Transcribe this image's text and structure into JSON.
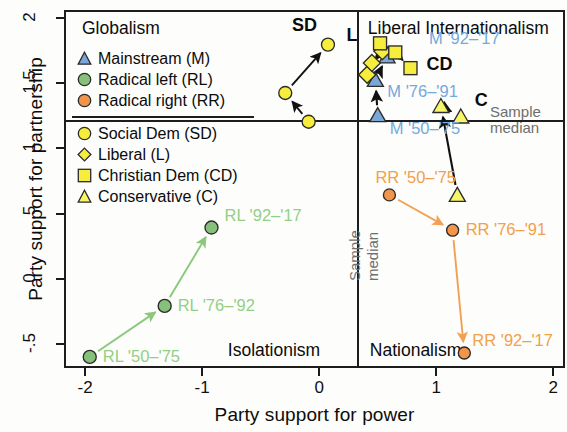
{
  "chart_data": {
    "type": "scatter",
    "title": "",
    "xlabel": "Party support for power",
    "ylabel": "Party support for partnership",
    "xlim": [
      -2.18,
      2.1
    ],
    "ylim": [
      -0.68,
      2.06
    ],
    "xticks": [
      "-2",
      "-1",
      "0",
      "1",
      "2"
    ],
    "xtick_values": [
      -2,
      -1,
      0,
      1,
      2
    ],
    "yticks": [
      "-.5",
      "0",
      ".5",
      "1",
      "1.5",
      "2"
    ],
    "ytick_values": [
      -0.5,
      0,
      0.5,
      1,
      1.5,
      2
    ],
    "grid": false,
    "legend_position": "top-left-inside",
    "sample_median": {
      "x": 0.33,
      "y": 1.21,
      "label": "Sample median"
    },
    "quadrant_labels": [
      {
        "text": "Globalism",
        "quadrant": "top-left"
      },
      {
        "text": "Liberal Internationalism",
        "quadrant": "top-right"
      },
      {
        "text": "Isolationism",
        "quadrant": "bottom-left"
      },
      {
        "text": "Nationalism",
        "quadrant": "bottom-right"
      }
    ],
    "legend_groups": [
      {
        "entries": [
          {
            "symbol": "triangle",
            "color": "#7BA7D7",
            "label": "Mainstream (M)",
            "key": "M"
          },
          {
            "symbol": "circle",
            "color": "#86C07A",
            "label": "Radical left (RL)",
            "key": "RL"
          },
          {
            "symbol": "circle",
            "color": "#F2944A",
            "label": "Radical right (RR)",
            "key": "RR"
          }
        ]
      },
      {
        "entries": [
          {
            "symbol": "circle",
            "color": "#F7ED3C",
            "label": "Social Dem (SD)",
            "key": "SD"
          },
          {
            "symbol": "diamond",
            "color": "#F7ED3C",
            "label": "Liberal (L)",
            "key": "L"
          },
          {
            "symbol": "square",
            "color": "#F7ED3C",
            "label": "Christian Dem (CD)",
            "key": "CD"
          },
          {
            "symbol": "triangle",
            "color": "#F7F66B",
            "label": "Conservative (C)",
            "key": "C"
          }
        ]
      }
    ],
    "series": [
      {
        "name": "Radical left (RL)",
        "key": "RL",
        "symbol": "circle",
        "color": "#86C07A",
        "points": [
          {
            "label": "RL '50–'75",
            "x": -1.96,
            "y": -0.595
          },
          {
            "label": "RL '76–'92",
            "x": -1.32,
            "y": -0.205
          },
          {
            "label": "RL '92–'17",
            "x": -0.92,
            "y": 0.395
          }
        ]
      },
      {
        "name": "Radical right (RR)",
        "key": "RR",
        "symbol": "circle",
        "color": "#F2944A",
        "points": [
          {
            "label": "RR '50–'75",
            "x": 0.6,
            "y": 0.645
          },
          {
            "label": "RR '76–'91",
            "x": 1.14,
            "y": 0.375
          },
          {
            "label": "RR '92–'17",
            "x": 1.24,
            "y": -0.565
          }
        ]
      },
      {
        "name": "Mainstream (M)",
        "key": "M",
        "symbol": "triangle",
        "color": "#7BA7D7",
        "points": [
          {
            "label": "M '50–'75",
            "x": 0.5,
            "y": 1.255
          },
          {
            "label": "M '76–'91",
            "x": 0.48,
            "y": 1.525
          },
          {
            "label": "M '92–'17",
            "x": 0.58,
            "y": 1.705
          }
        ]
      },
      {
        "name": "Social Dem (SD)",
        "key": "SD",
        "symbol": "circle",
        "color": "#F7ED3C",
        "points": [
          {
            "label": "",
            "x": -0.09,
            "y": 1.205
          },
          {
            "label": "",
            "x": -0.29,
            "y": 1.425
          },
          {
            "label": "SD",
            "x": 0.075,
            "y": 1.795
          }
        ]
      },
      {
        "name": "Liberal (L)",
        "key": "L",
        "symbol": "diamond",
        "color": "#F7ED3C",
        "points": [
          {
            "label": "",
            "x": 0.41,
            "y": 1.565
          },
          {
            "label": "",
            "x": 0.45,
            "y": 1.655
          },
          {
            "label": "L",
            "x": 0.54,
            "y": 1.745
          }
        ]
      },
      {
        "name": "Christian Dem (CD)",
        "key": "CD",
        "symbol": "square",
        "color": "#F7ED3C",
        "points": [
          {
            "label": "",
            "x": 0.52,
            "y": 1.805
          },
          {
            "label": "",
            "x": 0.65,
            "y": 1.735
          },
          {
            "label": "CD",
            "x": 0.78,
            "y": 1.615
          }
        ]
      },
      {
        "name": "Conservative (C)",
        "key": "C",
        "symbol": "triangle",
        "color": "#F7F66B",
        "points": [
          {
            "label": "",
            "x": 1.18,
            "y": 0.645
          },
          {
            "label": "",
            "x": 1.04,
            "y": 1.325
          },
          {
            "label": "C",
            "x": 1.21,
            "y": 1.245
          }
        ]
      }
    ]
  },
  "axes": {
    "x_title": "Party support for power",
    "y_title": "Party support for partnership",
    "x_ticks": [
      "-2",
      "-1",
      "0",
      "1",
      "2"
    ],
    "y_ticks": [
      "2",
      "1.5",
      "1",
      ".5",
      "0",
      "-.5"
    ]
  },
  "quadrants": {
    "top_left": "Globalism",
    "top_right": "Liberal Internationalism",
    "bottom_left": "Isolationism",
    "bottom_right": "Nationalism"
  },
  "annotations": {
    "sample_median_line1": "Sample",
    "sample_median_line2": "median",
    "sample_median_vert1": "Sample",
    "sample_median_vert2": "median"
  },
  "legend": {
    "group1": [
      {
        "label": "Mainstream (M)",
        "icon": "triangle-marker-icon",
        "color": "#7BA7D7"
      },
      {
        "label": "Radical left (RL)",
        "icon": "circle-marker-icon",
        "color": "#86C07A"
      },
      {
        "label": "Radical right (RR)",
        "icon": "circle-marker-icon",
        "color": "#F2944A"
      }
    ],
    "group2": [
      {
        "label": "Social Dem (SD)",
        "icon": "circle-marker-icon",
        "color": "#F7ED3C"
      },
      {
        "label": "Liberal (L)",
        "icon": "diamond-marker-icon",
        "color": "#F7ED3C"
      },
      {
        "label": "Christian Dem (CD)",
        "icon": "square-marker-icon",
        "color": "#F7ED3C"
      },
      {
        "label": "Conservative (C)",
        "icon": "triangle-marker-icon",
        "color": "#F7F66B"
      }
    ]
  },
  "point_labels": {
    "sd": "SD",
    "l": "L",
    "cd": "CD",
    "c": "C",
    "m_50_75": "M '50–'75",
    "m_76_91": "M '76–'91",
    "m_92_17": "M '92–'17",
    "rl_50_75": "RL '50–'75",
    "rl_76_92": "RL '76–'92",
    "rl_92_17": "RL '92–'17",
    "rr_50_75": "RR '50–'75",
    "rr_76_91": "RR '76–'91",
    "rr_92_17": "RR '92–'17"
  }
}
